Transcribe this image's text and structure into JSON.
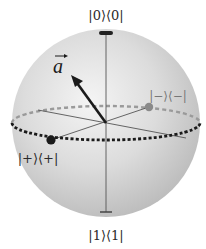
{
  "diagram": {
    "labels": {
      "top": "|0⟩⟨0|",
      "bottom": "|1⟩⟨1|",
      "plus": "|+⟩⟨+|",
      "minus": "|−⟩⟨−|",
      "vector": "a"
    },
    "colors": {
      "sphere_center": "#f2f2f2",
      "sphere_mid": "#d8d8d8",
      "sphere_edge": "#bdbdbd",
      "axis": "#555555",
      "vector": "#1a1a1a",
      "equator_front": "#1a1a1a",
      "equator_back": "#9a9a9a",
      "plus_dot": "#1a1a1a",
      "minus_dot": "#8a8a8a"
    },
    "geometry": {
      "center": [
        106,
        123
      ],
      "radius": 94,
      "equator_ry": 17
    }
  }
}
